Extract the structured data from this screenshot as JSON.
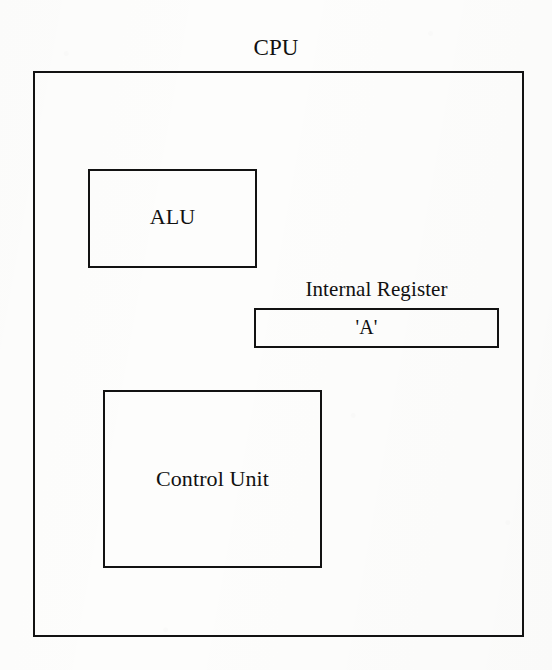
{
  "diagram": {
    "title": "CPU",
    "outer_block": {
      "name": "CPU",
      "label": "CPU"
    },
    "blocks": [
      {
        "id": "alu",
        "label": "ALU",
        "description": "Arithmetic Logic Unit block"
      },
      {
        "id": "internal-register",
        "caption": "Internal Register",
        "value": "'A'",
        "description": "Internal register bar labelled 'A'"
      },
      {
        "id": "control-unit",
        "label": "Control Unit",
        "description": "Control Unit block"
      }
    ],
    "style": {
      "line_color": "#121212",
      "background_color": "#fdfdfc",
      "text_color": "#111111"
    }
  }
}
